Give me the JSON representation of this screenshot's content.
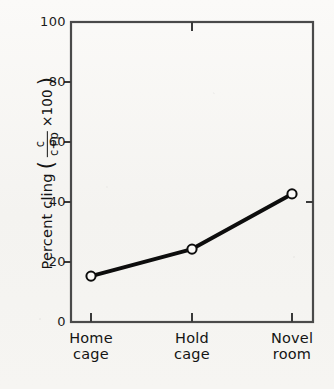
{
  "chart_data": {
    "type": "line",
    "title": "",
    "subtitle": "",
    "xlabel": "",
    "ylabel": "Percent cling",
    "ylabel_formula": {
      "open_paren": "(",
      "numerator": "c",
      "denominator": "c+p",
      "multiplier": "×100",
      "close_paren": ")"
    },
    "categories": [
      "Home cage",
      "Hold cage",
      "Novel room"
    ],
    "category_lines": [
      {
        "line1": "Home",
        "line2": "cage"
      },
      {
        "line1": "Hold",
        "line2": "cage"
      },
      {
        "line1": "Novel",
        "line2": "room"
      }
    ],
    "values": [
      15.3,
      24.3,
      42.7
    ],
    "series": [
      {
        "name": "Percent cling",
        "values": [
          15.3,
          24.3,
          42.7
        ],
        "marker": "open-circle",
        "line_color": "#0d0d0d",
        "marker_fill": "#ffffff",
        "line_width": 4
      }
    ],
    "ylim": [
      0,
      100
    ],
    "yticks": [
      0,
      20,
      40,
      60,
      80,
      100
    ],
    "ytick_labels": [
      "0",
      "20",
      "40",
      "60",
      "80",
      "100"
    ],
    "grid": false,
    "legend": "none",
    "frame": "box",
    "annotations": []
  },
  "figure": {
    "background_color": "#f7f6f3",
    "axis_color": "#3a3a3a",
    "text_color": "#141414"
  }
}
